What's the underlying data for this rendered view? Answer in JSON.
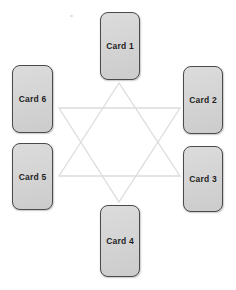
{
  "cards": [
    {
      "label": "Card 1",
      "position": "top-center"
    },
    {
      "label": "Card 2",
      "position": "upper-right"
    },
    {
      "label": "Card 3",
      "position": "lower-right"
    },
    {
      "label": "Card 4",
      "position": "bottom-center"
    },
    {
      "label": "Card 5",
      "position": "lower-left"
    },
    {
      "label": "Card 6",
      "position": "upper-left"
    }
  ],
  "star": {
    "shape": "hexagram",
    "triangles": [
      {
        "name": "up-triangle",
        "points": "119,83 59,176 180,176"
      },
      {
        "name": "down-triangle",
        "points": "59,108 180,108 119,202"
      }
    ]
  },
  "colors": {
    "background": "#ffffff",
    "card_fill": "#d4d4d4",
    "card_border": "#4b4b4b",
    "card_text": "#1f1f1f",
    "star_line": "#dcdcdc"
  }
}
